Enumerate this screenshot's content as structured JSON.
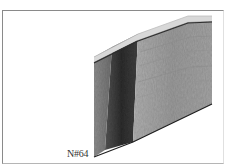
{
  "figure": {
    "panel_label": "N#64",
    "colors": {
      "frame": "#8a8a8a",
      "slab_light": "#a8a8a8",
      "slab_mid": "#8c8c8c",
      "slab_dark": "#3a3a3a",
      "top_edge": "#d8d8d8",
      "top_line": "#2e2e2e"
    }
  }
}
